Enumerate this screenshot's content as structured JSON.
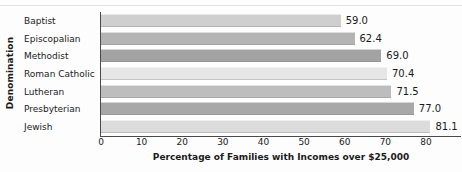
{
  "chart_data": {
    "type": "bar",
    "orientation": "horizontal",
    "title": "",
    "xlabel": "Percentage of Families with Incomes over $25,000",
    "ylabel": "Denomination",
    "xlim": [
      0,
      80
    ],
    "xticks": [
      0,
      10,
      20,
      30,
      40,
      50,
      60,
      70,
      80
    ],
    "xtick_labels": [
      "0",
      "10",
      "20",
      "30",
      "40",
      "50",
      "60",
      "70",
      "80"
    ],
    "grid": false,
    "legend": false,
    "categories": [
      "Baptist",
      "Episcopalian",
      "Methodist",
      "Roman Catholic",
      "Lutheran",
      "Presbyterian",
      "Jewish"
    ],
    "values": [
      59.0,
      62.4,
      69.0,
      70.4,
      71.5,
      77.0,
      81.1
    ],
    "value_labels": [
      "59.0",
      "62.4",
      "69.0",
      "70.4",
      "71.5",
      "77.0",
      "81.1"
    ],
    "bar_colors": [
      "#cfcfcf",
      "#b4b4b4",
      "#a3a3a3",
      "#e6e6e6",
      "#bdbdbd",
      "#a8a8a8",
      "#dcdcdc"
    ],
    "axis_color": "#4a4a4a",
    "text_color": "#1a1a1a",
    "background": "#fdfdfd"
  }
}
